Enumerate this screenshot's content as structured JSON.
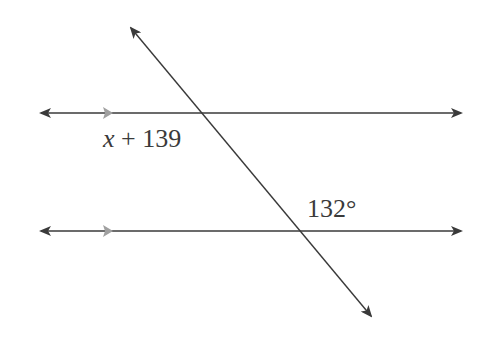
{
  "diagram": {
    "type": "parallel-lines-transversal",
    "colors": {
      "line": "#3a3a3a",
      "parallel_marker": "#a0a0a0",
      "background": "#ffffff"
    },
    "lines": [
      {
        "name": "upper-parallel-line",
        "x1": 41,
        "y1": 113,
        "x2": 461,
        "y2": 113,
        "arrows": "both"
      },
      {
        "name": "lower-parallel-line",
        "x1": 41,
        "y1": 231,
        "x2": 461,
        "y2": 231,
        "arrows": "both"
      },
      {
        "name": "transversal-line",
        "x1": 131,
        "y1": 28,
        "x2": 371,
        "y2": 316,
        "arrows": "both"
      }
    ],
    "parallel_markers": [
      {
        "name": "upper-parallel-marker",
        "x": 103,
        "y": 113
      },
      {
        "name": "lower-parallel-marker",
        "x": 103,
        "y": 231
      }
    ],
    "labels": {
      "upper_angle": {
        "variable": "x",
        "operator": "+",
        "constant": "139"
      },
      "lower_angle": {
        "value": "132°"
      }
    }
  }
}
